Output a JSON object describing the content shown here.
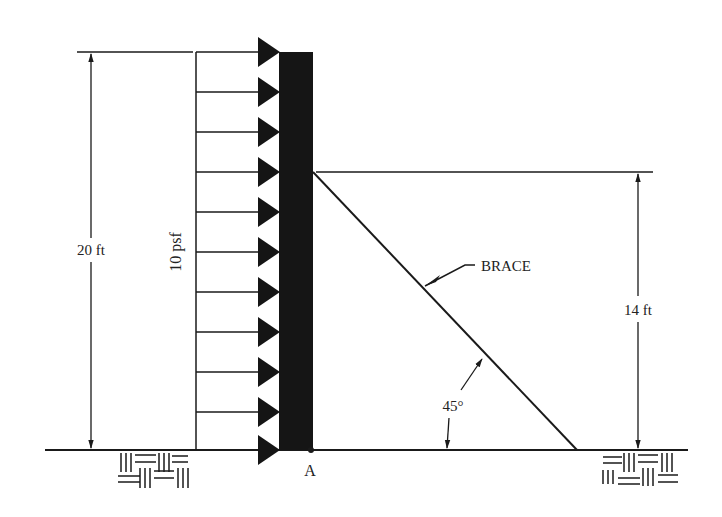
{
  "diagram": {
    "labels": {
      "height_total": "20 ft",
      "load": "10 psf",
      "brace": "BRACE",
      "brace_height": "14 ft",
      "angle": "45°",
      "point_a": "A"
    },
    "geometry": {
      "wall_height_ft": 20,
      "brace_attach_height_ft": 14,
      "brace_angle_deg": 45,
      "distributed_load_psf": 10,
      "load_arrow_count": 11
    },
    "colors": {
      "ink": "#1a1a1a",
      "wall": "#151515",
      "background": "#ffffff"
    }
  }
}
